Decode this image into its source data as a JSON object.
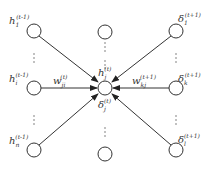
{
  "diagram": {
    "type": "neural-network-backprop",
    "center_node": {
      "label": "h",
      "sub": "j",
      "sup": "(t)",
      "below_label": "δ",
      "below_sub": "j",
      "below_sup": "(t)"
    },
    "left_nodes": [
      {
        "label": "h",
        "sub": "1",
        "sup": "(t-1)"
      },
      {
        "label": "h",
        "sub": "i",
        "sup": "(t-1)"
      },
      {
        "label": "h",
        "sub": "n",
        "sup": "(t-1)"
      }
    ],
    "right_nodes": [
      {
        "label": "δ",
        "sub": "1",
        "sup": "(t+1)"
      },
      {
        "label": "δ",
        "sub": "k",
        "sup": "(t+1)"
      },
      {
        "label": "δ",
        "sub": "l",
        "sup": "(t+1)"
      }
    ],
    "edge_labels": {
      "left": {
        "label": "w",
        "sub": "ji",
        "sup": "(t)"
      },
      "right": {
        "label": "w",
        "sub": "kj",
        "sup": "(t+1)"
      }
    },
    "ellipsis": "⋮"
  }
}
